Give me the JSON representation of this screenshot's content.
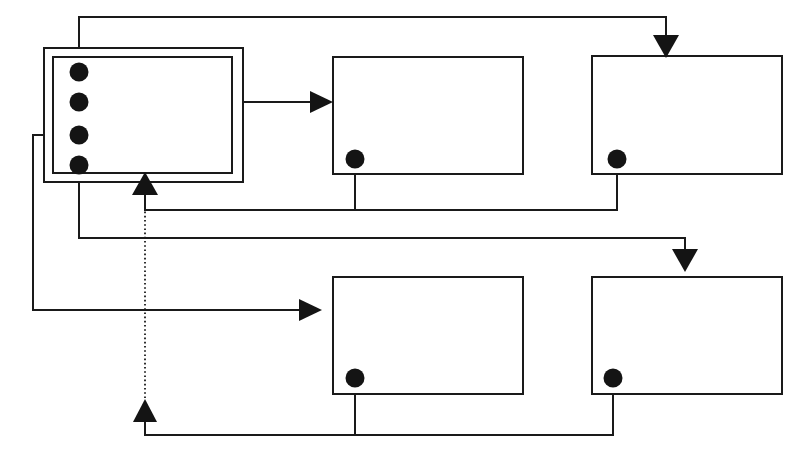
{
  "diagram": {
    "canvas": {
      "width": 802,
      "height": 460,
      "background": "#ffffff"
    },
    "style": {
      "line_color": "#1a1a1a",
      "dot_color": "#141414",
      "node_fill": "#ffffff",
      "line_width": 2,
      "thin_line_width": 1.6
    },
    "nodes": [
      {
        "id": "controller",
        "name": "main-controller-block",
        "label": "",
        "shape": "double-rectangle",
        "outer": {
          "x": 44,
          "y": 48,
          "width": 199,
          "height": 134
        },
        "inner": {
          "x": 53,
          "y": 57,
          "width": 179,
          "height": 116
        },
        "ports": [
          {
            "id": "p1",
            "name": "port-1",
            "cx": 79,
            "cy": 72,
            "r": 9
          },
          {
            "id": "p2",
            "name": "port-2",
            "cx": 79,
            "cy": 102,
            "r": 9
          },
          {
            "id": "p3",
            "name": "port-3",
            "cx": 79,
            "cy": 135,
            "r": 9
          },
          {
            "id": "p4",
            "name": "port-4",
            "cx": 79,
            "cy": 165,
            "r": 9
          }
        ]
      },
      {
        "id": "top_middle",
        "name": "top-middle-block",
        "label": "",
        "shape": "rectangle",
        "rect": {
          "x": 333,
          "y": 57,
          "width": 190,
          "height": 117
        },
        "ports": [
          {
            "id": "tm_out",
            "name": "output-port",
            "cx": 355,
            "cy": 159,
            "r": 9
          }
        ]
      },
      {
        "id": "top_right",
        "name": "top-right-block",
        "label": "",
        "shape": "rectangle",
        "rect": {
          "x": 592,
          "y": 56,
          "width": 190,
          "height": 118
        },
        "ports": [
          {
            "id": "tr_out",
            "name": "output-port",
            "cx": 617,
            "cy": 159,
            "r": 9
          }
        ]
      },
      {
        "id": "bottom_middle",
        "name": "bottom-middle-block",
        "label": "",
        "shape": "rectangle",
        "rect": {
          "x": 333,
          "y": 277,
          "width": 190,
          "height": 117
        },
        "ports": [
          {
            "id": "bm_out",
            "name": "output-port",
            "cx": 355,
            "cy": 378,
            "r": 9
          }
        ]
      },
      {
        "id": "bottom_right",
        "name": "bottom-right-block",
        "label": "",
        "shape": "rectangle",
        "rect": {
          "x": 592,
          "y": 277,
          "width": 190,
          "height": 117
        },
        "ports": [
          {
            "id": "br_out",
            "name": "output-port",
            "cx": 613,
            "cy": 378,
            "r": 9
          }
        ]
      }
    ],
    "edges": [
      {
        "id": "e1",
        "name": "edge-port1-to-top-right",
        "style": "solid",
        "from": "controller.p1",
        "to": "top_right.top",
        "points": "79,72 79,17 666,17 666,48",
        "arrow": {
          "x": 666,
          "y": 56,
          "direction": "down"
        }
      },
      {
        "id": "e2",
        "name": "edge-port2-to-top-middle",
        "style": "solid",
        "from": "controller.p2",
        "to": "top_middle.left",
        "points": "79,102 325,102",
        "arrow": {
          "x": 333,
          "y": 102,
          "direction": "right"
        }
      },
      {
        "id": "e3",
        "name": "edge-port3-to-bottom-middle",
        "style": "solid",
        "from": "controller.p3",
        "to": "bottom_middle.left",
        "points": "79,135 33,135 33,310 313,310",
        "arrow": {
          "x": 321,
          "y": 310,
          "direction": "right"
        }
      },
      {
        "id": "e4",
        "name": "edge-port4-to-bottom-right",
        "style": "solid",
        "from": "controller.p4",
        "to": "bottom_right.top",
        "points": "79,165 79,238 685,238 685,249",
        "arrow": {
          "x": 685,
          "y": 257,
          "direction": "down"
        }
      },
      {
        "id": "e5",
        "name": "edge-top-outputs-to-controller-feedback",
        "style": "solid",
        "from": "top_right.tr_out",
        "to": "feedback-junction",
        "points": "617,159 617,210 145,210 145,190",
        "arrow": {
          "x": 145,
          "y": 178,
          "direction": "up"
        }
      },
      {
        "id": "e6",
        "name": "edge-top-middle-output-join",
        "style": "solid",
        "from": "top_middle.tm_out",
        "to": "feedback-bus-top",
        "points": "355,159 355,210"
      },
      {
        "id": "e7",
        "name": "edge-bottom-outputs-to-controller-feedback",
        "style": "solid",
        "from": "bottom_right.br_out",
        "to": "bottom-feedback-junction",
        "points": "613,378 613,435 145,435 145,417",
        "arrow": {
          "x": 145,
          "y": 405,
          "direction": "up"
        }
      },
      {
        "id": "e8",
        "name": "edge-bottom-middle-output-join",
        "style": "solid",
        "from": "bottom_middle.bm_out",
        "to": "feedback-bus-bottom",
        "points": "355,378 355,435"
      },
      {
        "id": "e9",
        "name": "edge-dotted-feedback-to-controller",
        "style": "dotted",
        "from": "bottom-feedback-junction",
        "to": "controller.bottom",
        "points": "145,400 145,186"
      }
    ],
    "arrow_markers": [
      {
        "id": "a1",
        "name": "arrowhead-into-top-right-block",
        "x": 666,
        "y": 56,
        "direction": "down"
      },
      {
        "id": "a2",
        "name": "arrowhead-into-top-middle-block",
        "x": 333,
        "y": 102,
        "direction": "right"
      },
      {
        "id": "a3",
        "name": "arrowhead-into-bottom-middle-block",
        "x": 321,
        "y": 310,
        "direction": "right"
      },
      {
        "id": "a4",
        "name": "arrowhead-into-bottom-right-block",
        "x": 685,
        "y": 257,
        "direction": "down"
      },
      {
        "id": "a5",
        "name": "arrowhead-into-controller-top-feedback",
        "x": 145,
        "y": 178,
        "direction": "up"
      },
      {
        "id": "a6",
        "name": "arrowhead-into-controller-bottom-feedback",
        "x": 145,
        "y": 405,
        "direction": "up"
      }
    ]
  }
}
